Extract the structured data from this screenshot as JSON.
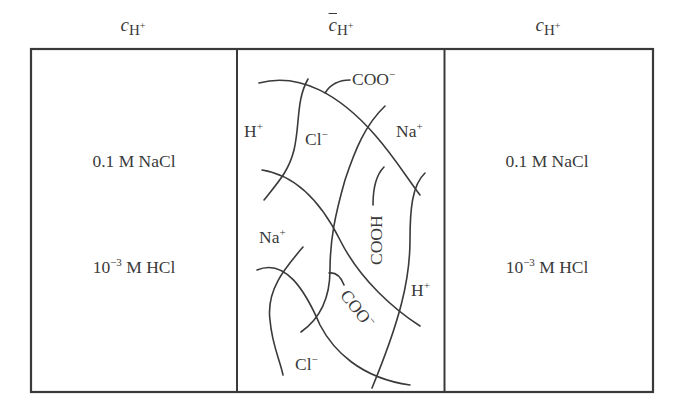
{
  "headers": {
    "left": {
      "symbol": "c",
      "subscript": "H",
      "charge": "+"
    },
    "middle": {
      "symbol": "c",
      "subscript": "H",
      "charge": "+",
      "overbar": true
    },
    "right": {
      "symbol": "c",
      "subscript": "H",
      "charge": "+"
    }
  },
  "left_solution": {
    "line1": "0.1 M NaCl",
    "line2_base": "10",
    "line2_exp": "−3",
    "line2_rest": " M HCl"
  },
  "right_solution": {
    "line1": "0.1 M NaCl",
    "line2_base": "10",
    "line2_exp": "−3",
    "line2_rest": " M HCl"
  },
  "membrane_labels": {
    "h_top": {
      "base": "H",
      "charge": "+"
    },
    "cl_top": {
      "base": "Cl",
      "charge": "−"
    },
    "coo_top": {
      "base": "COO",
      "charge": "−"
    },
    "na_top": {
      "base": "Na",
      "charge": "+"
    },
    "cooh": "COOH",
    "na_mid": {
      "base": "Na",
      "charge": "+"
    },
    "h_mid": {
      "base": "H",
      "charge": "+"
    },
    "coo_bottom": {
      "base": "COO",
      "charge": "−"
    },
    "cl_bottom": {
      "base": "Cl",
      "charge": "−"
    }
  },
  "colors": {
    "stroke": "#3a3a3a",
    "background": "#ffffff"
  }
}
